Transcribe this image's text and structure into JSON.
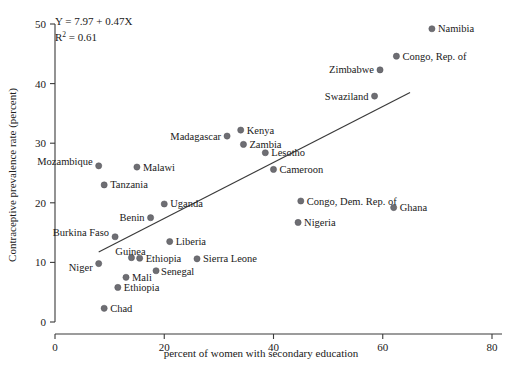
{
  "chart_data": {
    "type": "scatter",
    "title": "",
    "xlabel": "percent of women with secondary education",
    "ylabel": "Contraceptive prevalence rate (percent)",
    "xlim": [
      0,
      80
    ],
    "ylim": [
      0,
      50
    ],
    "xticks": [
      0,
      20,
      40,
      60,
      80
    ],
    "yticks": [
      0,
      10,
      20,
      30,
      40,
      50
    ],
    "grid": false,
    "legend": "none",
    "annotations": {
      "equation": "Y = 7.97 + 0.47X",
      "r_squared_label": "R",
      "r_squared_exponent": "2",
      "r_squared_value": " = 0.61"
    },
    "fit_line": {
      "intercept": 7.97,
      "slope": 0.47,
      "x_start": 8,
      "x_end": 65
    },
    "points": [
      {
        "label": "Namibia",
        "x": 69.0,
        "y": 49.2,
        "lx": 6,
        "ly": 3.5
      },
      {
        "label": "Congo, Rep. of",
        "x": 62.5,
        "y": 44.6,
        "lx": 6,
        "ly": 3.5
      },
      {
        "label": "Zimbabwe",
        "x": 59.5,
        "y": 42.3,
        "lx": -6,
        "ly": 3.5,
        "anchor": "end"
      },
      {
        "label": "Swaziland",
        "x": 58.5,
        "y": 37.9,
        "lx": -6,
        "ly": 3.5,
        "anchor": "end"
      },
      {
        "label": "Kenya",
        "x": 34.0,
        "y": 32.2,
        "lx": 6,
        "ly": 3.5
      },
      {
        "label": "Madagascar",
        "x": 31.5,
        "y": 31.2,
        "lx": -6,
        "ly": 3.5,
        "anchor": "end"
      },
      {
        "label": "Zambia",
        "x": 34.5,
        "y": 29.8,
        "lx": 6,
        "ly": 3.5
      },
      {
        "label": "Lesotho",
        "x": 38.5,
        "y": 28.4,
        "lx": 6,
        "ly": 3.5
      },
      {
        "label": "Mozambique",
        "x": 8.0,
        "y": 26.2,
        "lx": -6,
        "ly": -1.0,
        "anchor": "end"
      },
      {
        "label": "Malawi",
        "x": 15.0,
        "y": 26.0,
        "lx": 6,
        "ly": 3.5
      },
      {
        "label": "Cameroon",
        "x": 40.0,
        "y": 25.6,
        "lx": 6,
        "ly": 3.5
      },
      {
        "label": "Tanzania",
        "x": 9.0,
        "y": 23.0,
        "lx": 6,
        "ly": 3.5
      },
      {
        "label": "Congo, Dem. Rep. of",
        "x": 45.0,
        "y": 20.3,
        "lx": 6,
        "ly": 3.5
      },
      {
        "label": "Uganda",
        "x": 20.0,
        "y": 19.8,
        "lx": 6,
        "ly": 3.5
      },
      {
        "label": "Ghana",
        "x": 62.0,
        "y": 19.2,
        "lx": 6,
        "ly": 3.5
      },
      {
        "label": "Benin",
        "x": 17.5,
        "y": 17.5,
        "lx": -6,
        "ly": 3.5,
        "anchor": "end"
      },
      {
        "label": "Nigeria",
        "x": 44.5,
        "y": 16.7,
        "lx": 6,
        "ly": 3.5
      },
      {
        "label": "Burkina Faso",
        "x": 11.0,
        "y": 14.3,
        "lx": -6,
        "ly": -1.0,
        "anchor": "end"
      },
      {
        "label": "Liberia",
        "x": 21.0,
        "y": 13.5,
        "lx": 6,
        "ly": 3.5
      },
      {
        "label": "Guinea",
        "x": 14.0,
        "y": 10.8,
        "lx": -1,
        "ly": -2.6,
        "anchor": "middle"
      },
      {
        "label": "Ethiopia",
        "x": 15.5,
        "y": 10.7,
        "lx": 6,
        "ly": 3.5
      },
      {
        "label": "Sierra Leone",
        "x": 26.0,
        "y": 10.6,
        "lx": 6,
        "ly": 3.5
      },
      {
        "label": "Niger",
        "x": 8.0,
        "y": 9.8,
        "lx": -6,
        "ly": 7.0,
        "anchor": "end"
      },
      {
        "label": "Senegal",
        "x": 18.5,
        "y": 8.6,
        "lx": 5,
        "ly": 4.5
      },
      {
        "label": "Mali",
        "x": 13.0,
        "y": 7.5,
        "lx": 6,
        "ly": 3.5
      },
      {
        "label": "Ethiopia",
        "x": 11.5,
        "y": 5.8,
        "lx": 6,
        "ly": 3.5
      },
      {
        "label": "Chad",
        "x": 9.0,
        "y": 2.3,
        "lx": 6,
        "ly": 3.5
      }
    ]
  }
}
